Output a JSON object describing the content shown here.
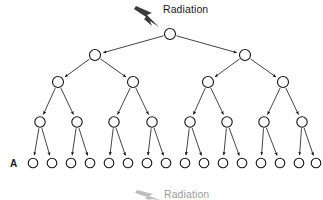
{
  "diagram": {
    "background_color": "#ffffff",
    "stroke_color": "#141414",
    "bolt_color": "#3b3b3b",
    "width": 323,
    "height": 200
  },
  "annotations": {
    "top_radiation_label": "Radiation",
    "bottom_radiation_label": "Radiation",
    "row_label_a": "A"
  },
  "icons": {
    "lightning_bolt": "lightning-bolt-icon"
  },
  "chart_data": {
    "type": "tree",
    "title": "Radiation",
    "branching_factor": 2,
    "levels": [
      {
        "index": 0,
        "y": 34,
        "count": 1,
        "x": [
          170
        ]
      },
      {
        "index": 1,
        "y": 55,
        "count": 2,
        "x": [
          95,
          245
        ]
      },
      {
        "index": 2,
        "y": 82,
        "count": 4,
        "x": [
          58,
          133,
          208,
          283
        ]
      },
      {
        "index": 3,
        "y": 122,
        "count": 8,
        "x": [
          40,
          77,
          114,
          152,
          190,
          227,
          264,
          302
        ]
      },
      {
        "index": 4,
        "y": 163,
        "count": 16,
        "x": [
          33,
          52,
          71,
          90,
          109,
          128,
          147,
          166,
          185,
          204,
          223,
          242,
          261,
          280,
          299,
          316
        ]
      }
    ],
    "node_radii": [
      5.5,
      5.5,
      5.5,
      5.2,
      4.8
    ],
    "total_nodes": 31,
    "terminal_row_label": "A",
    "xlabel": "",
    "ylabel": "",
    "legend": []
  }
}
